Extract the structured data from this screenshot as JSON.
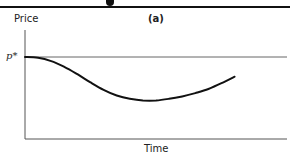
{
  "chart_data": {
    "type": "line",
    "title": "(a)",
    "xlabel": "Time",
    "ylabel": "Price",
    "reference_lines": [
      {
        "axis": "y",
        "label": "p*",
        "value": 1.0
      }
    ],
    "axis_ticks": {
      "x": [],
      "y": [
        "p*"
      ]
    },
    "grid": false,
    "legend": null,
    "series": [
      {
        "name": "price path",
        "x": [
          0,
          0.05,
          0.1,
          0.15,
          0.2,
          0.25,
          0.3,
          0.35,
          0.4,
          0.45,
          0.5,
          0.55,
          0.6,
          0.65,
          0.7,
          0.75,
          0.8
        ],
        "values": [
          1.0,
          0.99,
          0.95,
          0.88,
          0.79,
          0.69,
          0.6,
          0.53,
          0.49,
          0.47,
          0.47,
          0.49,
          0.52,
          0.56,
          0.61,
          0.68,
          0.76
        ]
      }
    ]
  },
  "labels": {
    "ylabel": "Price",
    "title": "(a)",
    "pstar": "p*",
    "xlabel": "Time"
  },
  "colors": {
    "axis": "#555555",
    "curve": "#111111",
    "reference_line": "#666666"
  }
}
